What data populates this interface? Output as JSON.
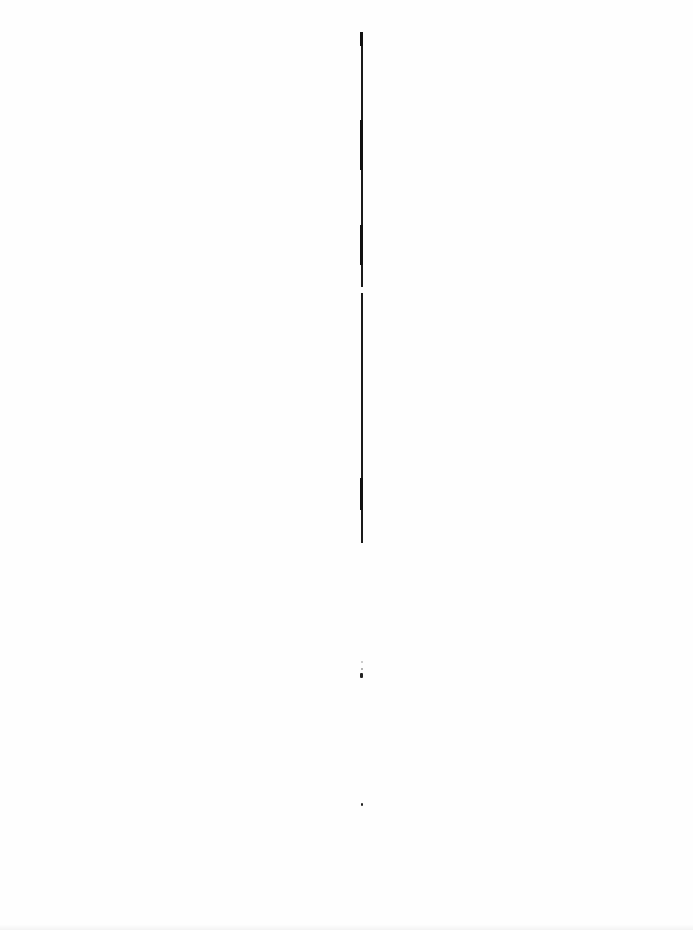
{
  "page": {
    "type": "blank-scanned-page",
    "background": "#fefefe",
    "rule_color": "#1a1a1a"
  },
  "vertical_rule": {
    "segments": [
      {
        "top": 32,
        "height": 255
      },
      {
        "top": 293,
        "height": 250
      }
    ],
    "thick_parts": [
      {
        "top": 32,
        "height": 14
      },
      {
        "top": 120,
        "height": 50
      },
      {
        "top": 225,
        "height": 40
      },
      {
        "top": 478,
        "height": 32
      }
    ]
  },
  "marks": [
    {
      "top": 661,
      "height": 2
    },
    {
      "top": 668,
      "height": 2
    },
    {
      "top": 673,
      "height": 5
    },
    {
      "top": 803,
      "height": 3
    }
  ]
}
